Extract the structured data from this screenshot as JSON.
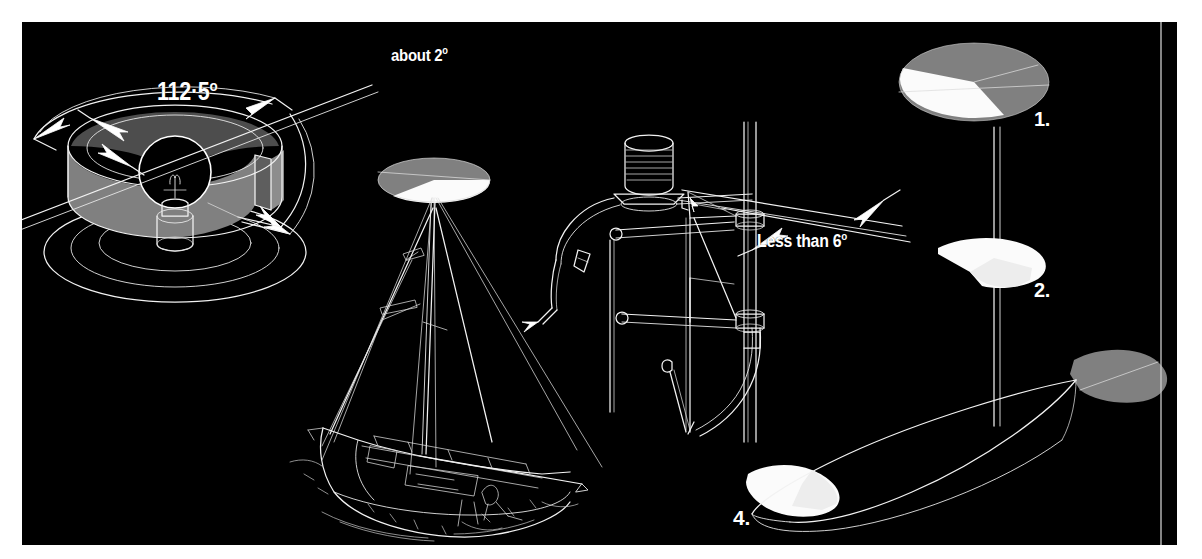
{
  "figure": {
    "background_color": "#ffffff",
    "plate_color": "#000000",
    "ink_color": "#ffffff",
    "gray_color": "#808080",
    "dark_gray_color": "#595959"
  },
  "annotations": {
    "cone_angle": {
      "value": "112·5",
      "unit": "o",
      "full": "112·5o"
    },
    "about_angle": {
      "prefix": "about ",
      "value": "2",
      "unit": "o",
      "full": "about 2o"
    },
    "less_than_angle": {
      "prefix": "Less than ",
      "value": "6",
      "unit": "o",
      "full": "Less than 6o"
    }
  },
  "callouts": [
    {
      "id": "1",
      "label": "1.",
      "description": "masthead light sector disc, gray and white segments"
    },
    {
      "id": "2",
      "label": "2.",
      "description": "lower white sector lobe on mast"
    },
    {
      "id": "3",
      "label": "3",
      "description": "gray stern sector shape at transom"
    },
    {
      "id": "4",
      "label": "4.",
      "description": "white bow sector shape at stem"
    }
  ],
  "drawings": [
    {
      "name": "lamp-housing-cutaway",
      "description": "cut-away cylindrical lamp housing with bulb showing 112·5 degree arc"
    },
    {
      "name": "sailboat-masthead-beam",
      "description": "sailboat with masthead light beam disc above"
    },
    {
      "name": "bow-fitting-detail",
      "description": "pulpit and bow navigation light fitting with rails"
    },
    {
      "name": "hull-plan-sectors",
      "description": "hull outline in plan view with bow and stern light sectors"
    }
  ]
}
